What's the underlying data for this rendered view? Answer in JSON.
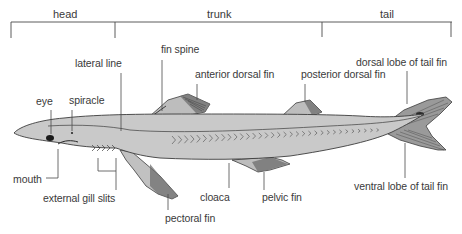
{
  "regions": [
    {
      "id": "head",
      "label": "head"
    },
    {
      "id": "trunk",
      "label": "trunk"
    },
    {
      "id": "tail",
      "label": "tail"
    }
  ],
  "labels": {
    "eye": "eye",
    "spiracle": "spiracle",
    "lateral_line": "lateral line",
    "fin_spine": "fin spine",
    "anterior_dorsal_fin": "anterior dorsal fin",
    "posterior_dorsal_fin": "posterior dorsal fin",
    "dorsal_lobe_tail": "dorsal lobe of tail fin",
    "ventral_lobe_tail": "ventral lobe of tail fin",
    "mouth": "mouth",
    "external_gill_slits": "external gill slits",
    "pectoral_fin": "pectoral fin",
    "cloaca": "cloaca",
    "pelvic_fin": "pelvic fin"
  },
  "colors": {
    "body_fill": "#c9c9c9",
    "fin_fill": "#bdbdbd",
    "outline": "#3c3c3c",
    "leader": "#4a4a4a",
    "text": "#3a3a3a"
  }
}
